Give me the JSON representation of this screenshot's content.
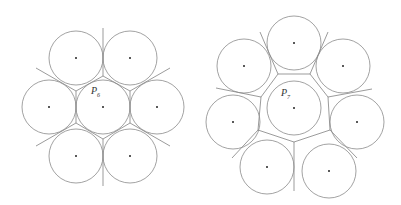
{
  "figures": [
    {
      "id": "left",
      "label_main": "P",
      "label_sub": "6",
      "label_pos": [
        91,
        85
      ],
      "radius": 27,
      "center": [
        103,
        107
      ],
      "neighbors": [
        [
          76,
          58
        ],
        [
          130,
          58
        ],
        [
          157,
          107
        ],
        [
          130,
          156
        ],
        [
          76,
          156
        ],
        [
          49,
          107
        ]
      ],
      "cell_polygon": [
        [
          103,
          76
        ],
        [
          130,
          91
        ],
        [
          130,
          123
        ],
        [
          103,
          139
        ],
        [
          76,
          123
        ],
        [
          76,
          91
        ]
      ],
      "outer_rays": [
        [
          [
            103,
            76
          ],
          [
            103,
            28
          ]
        ],
        [
          [
            130,
            91
          ],
          [
            170,
            68
          ]
        ],
        [
          [
            130,
            123
          ],
          [
            170,
            146
          ]
        ],
        [
          [
            103,
            139
          ],
          [
            103,
            186
          ]
        ],
        [
          [
            76,
            123
          ],
          [
            36,
            146
          ]
        ],
        [
          [
            76,
            91
          ],
          [
            36,
            68
          ]
        ]
      ]
    },
    {
      "id": "right",
      "label_main": "P",
      "label_sub": "7",
      "label_pos": [
        281,
        87
      ],
      "radius": 27,
      "center": [
        294,
        108
      ],
      "neighbors": [
        [
          294,
          43
        ],
        [
          343,
          66
        ],
        [
          357,
          122
        ],
        [
          329,
          171
        ],
        [
          267,
          167
        ],
        [
          233,
          122
        ],
        [
          244,
          66
        ]
      ],
      "cell_polygon": [
        [
          278,
          74
        ],
        [
          310,
          74
        ],
        [
          328,
          97
        ],
        [
          330,
          130
        ],
        [
          294,
          142
        ],
        [
          258,
          130
        ],
        [
          261,
          97
        ]
      ],
      "outer_rays": [
        [
          [
            278,
            74
          ],
          [
            260,
            32
          ]
        ],
        [
          [
            310,
            74
          ],
          [
            328,
            32
          ]
        ],
        [
          [
            328,
            97
          ],
          [
            372,
            89
          ]
        ],
        [
          [
            330,
            130
          ],
          [
            357,
            158
          ]
        ],
        [
          [
            294,
            142
          ],
          [
            294,
            191
          ]
        ],
        [
          [
            258,
            130
          ],
          [
            232,
            158
          ]
        ],
        [
          [
            261,
            97
          ],
          [
            216,
            88
          ]
        ]
      ]
    }
  ]
}
